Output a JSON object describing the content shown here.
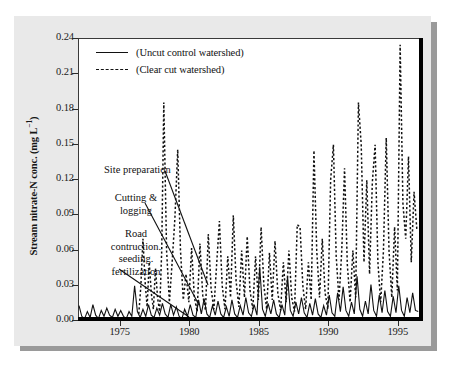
{
  "figure": {
    "panel_color": "#e9e9e9",
    "plot_background": "#ffffff",
    "axis_color": "#000000"
  },
  "ylabel_main": "Stream nitrate-N conc. (mg L",
  "ylabel_sup": "−1",
  "ylabel_close": ")",
  "legend": {
    "items": [
      {
        "label": "(Uncut control watershed)",
        "style": "solid"
      },
      {
        "label": "(Clear cut watershed)",
        "style": "dashed"
      }
    ]
  },
  "annotations": [
    {
      "name": "site-preparation",
      "text": "Site preparation"
    },
    {
      "name": "cutting-logging",
      "line1": "Cutting &",
      "line2": "logging"
    },
    {
      "name": "road-construction",
      "line1": "Road",
      "line2": "contruction.",
      "line3": "seeding.",
      "line4": "fertilization"
    }
  ],
  "chart_data": {
    "type": "line",
    "title": "",
    "xlabel": "",
    "ylabel": "Stream nitrate-N conc. (mg L−1)",
    "xlim": [
      1972.0,
      1996.6
    ],
    "ylim": [
      0.0,
      0.24
    ],
    "yticks": [
      0.0,
      0.03,
      0.06,
      0.09,
      0.12,
      0.15,
      0.18,
      0.21,
      0.24
    ],
    "ytick_labels": [
      "0.00",
      "0.03",
      "0.06",
      "0.09",
      "0.12",
      "0.15",
      "0.18",
      "0.21",
      "0.24"
    ],
    "xticks": [
      1975,
      1980,
      1985,
      1990,
      1995
    ],
    "xtick_labels": [
      "1975",
      "1980",
      "1985",
      "1990",
      "1995"
    ],
    "grid": false,
    "legend_position": "top-left",
    "series": [
      {
        "name": "(Uncut control watershed)",
        "style": "solid",
        "color": "#111111",
        "x": [
          1972.0,
          1972.2,
          1972.4,
          1972.6,
          1972.8,
          1973.0,
          1973.2,
          1973.4,
          1973.6,
          1973.8,
          1974.0,
          1974.2,
          1974.4,
          1974.6,
          1974.8,
          1975.0,
          1975.2,
          1975.4,
          1975.6,
          1975.8,
          1976.0,
          1976.2,
          1976.4,
          1976.6,
          1976.8,
          1977.0,
          1977.2,
          1977.4,
          1977.6,
          1977.8,
          1978.0,
          1978.2,
          1978.4,
          1978.6,
          1978.8,
          1979.0,
          1979.2,
          1979.4,
          1979.6,
          1979.8,
          1980.0,
          1980.2,
          1980.4,
          1980.6,
          1980.8,
          1981.0,
          1981.2,
          1981.4,
          1981.6,
          1981.8,
          1982.0,
          1982.2,
          1982.4,
          1982.6,
          1982.8,
          1983.0,
          1983.2,
          1983.4,
          1983.6,
          1983.8,
          1984.0,
          1984.2,
          1984.4,
          1984.6,
          1984.8,
          1985.0,
          1985.2,
          1985.4,
          1985.6,
          1985.8,
          1986.0,
          1986.2,
          1986.4,
          1986.6,
          1986.8,
          1987.0,
          1987.2,
          1987.4,
          1987.6,
          1987.8,
          1988.0,
          1988.2,
          1988.4,
          1988.6,
          1988.8,
          1989.0,
          1989.2,
          1989.4,
          1989.6,
          1989.8,
          1990.0,
          1990.2,
          1990.4,
          1990.6,
          1990.8,
          1991.0,
          1991.2,
          1991.4,
          1991.6,
          1991.8,
          1992.0,
          1992.2,
          1992.4,
          1992.6,
          1992.8,
          1993.0,
          1993.2,
          1993.4,
          1993.6,
          1993.8,
          1994.0,
          1994.2,
          1994.4,
          1994.6,
          1994.8,
          1995.0,
          1995.2,
          1995.4,
          1995.6,
          1995.8,
          1996.0,
          1996.2,
          1996.4
        ],
        "y": [
          0.013,
          0.004,
          0.002,
          0.008,
          0.003,
          0.014,
          0.005,
          0.002,
          0.009,
          0.004,
          0.011,
          0.005,
          0.003,
          0.01,
          0.004,
          0.009,
          0.004,
          0.002,
          0.008,
          0.004,
          0.03,
          0.008,
          0.003,
          0.01,
          0.004,
          0.014,
          0.005,
          0.003,
          0.011,
          0.005,
          0.015,
          0.006,
          0.003,
          0.014,
          0.005,
          0.012,
          0.004,
          0.002,
          0.01,
          0.004,
          0.014,
          0.005,
          0.003,
          0.018,
          0.006,
          0.019,
          0.006,
          0.003,
          0.013,
          0.005,
          0.017,
          0.006,
          0.003,
          0.012,
          0.004,
          0.018,
          0.006,
          0.003,
          0.013,
          0.005,
          0.02,
          0.007,
          0.004,
          0.014,
          0.005,
          0.046,
          0.01,
          0.004,
          0.015,
          0.006,
          0.018,
          0.006,
          0.003,
          0.014,
          0.005,
          0.038,
          0.009,
          0.004,
          0.016,
          0.006,
          0.02,
          0.007,
          0.003,
          0.015,
          0.005,
          0.019,
          0.006,
          0.003,
          0.013,
          0.005,
          0.022,
          0.007,
          0.004,
          0.024,
          0.008,
          0.029,
          0.009,
          0.004,
          0.016,
          0.006,
          0.038,
          0.01,
          0.004,
          0.017,
          0.006,
          0.031,
          0.009,
          0.004,
          0.022,
          0.007,
          0.026,
          0.008,
          0.004,
          0.021,
          0.007,
          0.03,
          0.009,
          0.004,
          0.02,
          0.007,
          0.024,
          0.009,
          0.008
        ]
      },
      {
        "name": "(Clear cut watershed)",
        "style": "dashed",
        "color": "#111111",
        "x": [
          1976.3,
          1976.45,
          1976.6,
          1976.75,
          1976.9,
          1977.05,
          1977.2,
          1977.35,
          1977.5,
          1977.65,
          1977.8,
          1977.95,
          1978.1,
          1978.3,
          1978.5,
          1978.7,
          1978.9,
          1979.1,
          1979.3,
          1979.5,
          1979.7,
          1979.9,
          1980.1,
          1980.3,
          1980.5,
          1980.7,
          1980.9,
          1981.1,
          1981.3,
          1981.5,
          1981.7,
          1981.9,
          1982.1,
          1982.3,
          1982.5,
          1982.7,
          1982.9,
          1983.1,
          1983.3,
          1983.5,
          1983.7,
          1983.9,
          1984.1,
          1984.3,
          1984.5,
          1984.7,
          1984.9,
          1985.1,
          1985.3,
          1985.5,
          1985.7,
          1985.9,
          1986.1,
          1986.3,
          1986.5,
          1986.7,
          1986.9,
          1987.1,
          1987.3,
          1987.5,
          1987.7,
          1987.9,
          1988.1,
          1988.3,
          1988.5,
          1988.7,
          1988.9,
          1989.1,
          1989.3,
          1989.5,
          1989.7,
          1989.9,
          1990.1,
          1990.3,
          1990.5,
          1990.7,
          1990.9,
          1991.1,
          1991.3,
          1991.5,
          1991.7,
          1991.9,
          1992.1,
          1992.3,
          1992.5,
          1992.7,
          1992.9,
          1993.1,
          1993.3,
          1993.5,
          1993.7,
          1993.9,
          1994.1,
          1994.3,
          1994.5,
          1994.7,
          1994.9,
          1995.1,
          1995.3,
          1995.5,
          1995.7,
          1995.9,
          1996.1,
          1996.3
        ],
        "y": [
          0.006,
          0.03,
          0.07,
          0.034,
          0.012,
          0.05,
          0.024,
          0.01,
          0.045,
          0.02,
          0.008,
          0.06,
          0.186,
          0.06,
          0.016,
          0.05,
          0.088,
          0.146,
          0.06,
          0.018,
          0.04,
          0.016,
          0.062,
          0.02,
          0.008,
          0.066,
          0.022,
          0.009,
          0.074,
          0.028,
          0.01,
          0.048,
          0.085,
          0.03,
          0.01,
          0.055,
          0.02,
          0.09,
          0.034,
          0.012,
          0.06,
          0.02,
          0.072,
          0.026,
          0.01,
          0.055,
          0.018,
          0.08,
          0.03,
          0.01,
          0.058,
          0.018,
          0.068,
          0.024,
          0.009,
          0.05,
          0.016,
          0.06,
          0.02,
          0.008,
          0.082,
          0.08,
          0.03,
          0.01,
          0.05,
          0.018,
          0.145,
          0.06,
          0.02,
          0.07,
          0.024,
          0.01,
          0.12,
          0.15,
          0.055,
          0.018,
          0.06,
          0.13,
          0.048,
          0.016,
          0.06,
          0.02,
          0.186,
          0.15,
          0.05,
          0.12,
          0.04,
          0.118,
          0.15,
          0.05,
          0.016,
          0.06,
          0.156,
          0.06,
          0.02,
          0.08,
          0.026,
          0.235,
          0.1,
          0.07,
          0.14,
          0.05,
          0.11,
          0.078
        ]
      }
    ]
  }
}
